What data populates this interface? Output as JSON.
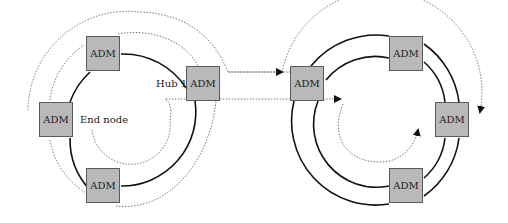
{
  "diagram": {
    "type": "dual-ring network",
    "left_ring": {
      "nodes": [
        {
          "label": "ADM",
          "position": "top"
        },
        {
          "label": "ADM",
          "position": "right",
          "role": "Hub 1"
        },
        {
          "label": "ADM",
          "position": "left"
        },
        {
          "label": "ADM",
          "position": "bottom"
        }
      ],
      "hub_label": "Hub 1",
      "end_node_label": "End node"
    },
    "right_ring": {
      "nodes": [
        {
          "label": "ADM",
          "position": "left"
        },
        {
          "label": "ADM",
          "position": "top"
        },
        {
          "label": "ADM",
          "position": "right"
        },
        {
          "label": "ADM",
          "position": "bottom"
        }
      ]
    },
    "colors": {
      "box_fill": "#b9b9b9",
      "box_border": "#5a5a5a",
      "ring_line": "#111111",
      "dotted_path": "#555555"
    }
  }
}
